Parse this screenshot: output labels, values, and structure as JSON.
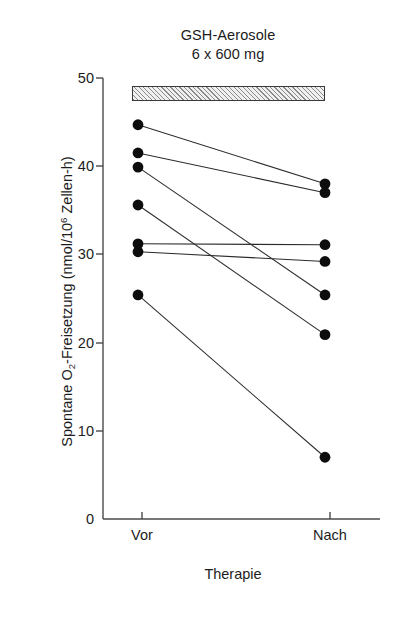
{
  "figure": {
    "annotation": {
      "line1": "GSH-Aerosole",
      "line2": "6 x 600 mg",
      "bar_name": "treatment-period-bar"
    },
    "axes": {
      "ylabel_parts": {
        "pre": "Spontane O",
        "sub": "2",
        "mid": "-Freisetzung (nmol/10",
        "sup": "6",
        "post": " Zellen-h)"
      },
      "ylabel_full": "Spontane O2-Freisetzung (nmol/10^6 Zellen-h)",
      "xlabel": "Therapie",
      "ytick_labels": [
        "50",
        "40",
        "30",
        "20",
        "10",
        "0"
      ],
      "xtick_labels": [
        "Vor",
        "Nach"
      ]
    }
  },
  "chart_data": {
    "type": "line",
    "subtype": "paired-slope-chart",
    "title": "GSH-Aerosole 6 x 600 mg",
    "xlabel": "Therapie",
    "ylabel": "Spontane O2-Freisetzung (nmol/10^6 Zellen-h)",
    "categories": [
      "Vor",
      "Nach"
    ],
    "ylim": [
      0,
      50
    ],
    "yticks": [
      0,
      10,
      20,
      30,
      40,
      50
    ],
    "grid": false,
    "legend": null,
    "n_pairs": 7,
    "series": [
      {
        "name": "Patient 1",
        "values": [
          44.7,
          38.0
        ]
      },
      {
        "name": "Patient 2",
        "values": [
          41.5,
          37.0
        ]
      },
      {
        "name": "Patient 3",
        "values": [
          39.9,
          25.4
        ]
      },
      {
        "name": "Patient 4",
        "values": [
          35.6,
          20.9
        ]
      },
      {
        "name": "Patient 5",
        "values": [
          31.2,
          31.1
        ]
      },
      {
        "name": "Patient 6",
        "values": [
          30.3,
          29.2
        ]
      },
      {
        "name": "Patient 7",
        "values": [
          25.4,
          7.0
        ]
      }
    ],
    "annotations": [
      {
        "text": "GSH-Aerosole",
        "position": "top-center"
      },
      {
        "text": "6 x 600 mg",
        "position": "top-center"
      },
      {
        "type": "hatched-bar",
        "text": "",
        "spans": [
          "Vor",
          "Nach"
        ],
        "position": "above-plot"
      }
    ]
  }
}
